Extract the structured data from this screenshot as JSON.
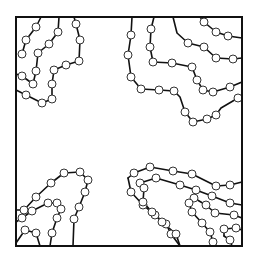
{
  "diagram": {
    "frame": {
      "x": 16,
      "y": 17,
      "width": 226,
      "height": 229
    },
    "colors": {
      "line": "#111111",
      "node_fill": "#ffffff",
      "node_stroke": "#333333",
      "background": "#ffffff"
    },
    "node_radius": 4,
    "paths": [
      {
        "id": "tl-1",
        "points": [
          [
            41,
            17
          ],
          [
            36,
            27
          ],
          [
            26,
            40
          ],
          [
            22,
            54
          ]
        ]
      },
      {
        "id": "tl-2",
        "points": [
          [
            59,
            17
          ],
          [
            58,
            32
          ],
          [
            49,
            44
          ],
          [
            38,
            53
          ],
          [
            36,
            71
          ],
          [
            33,
            84
          ],
          [
            22,
            76
          ],
          [
            16,
            74
          ]
        ]
      },
      {
        "id": "tl-3",
        "points": [
          [
            74,
            17
          ],
          [
            76,
            24
          ],
          [
            80,
            40
          ],
          [
            79,
            61
          ],
          [
            66,
            65
          ],
          [
            54,
            70
          ],
          [
            52,
            84
          ],
          [
            52,
            99
          ],
          [
            42,
            103
          ],
          [
            26,
            95
          ],
          [
            16,
            90
          ]
        ]
      },
      {
        "id": "tr-1",
        "points": [
          [
            132,
            17
          ],
          [
            131,
            35
          ],
          [
            128,
            55
          ],
          [
            131,
            77
          ],
          [
            141,
            89
          ],
          [
            159,
            90
          ],
          [
            174,
            91
          ],
          [
            180,
            97
          ],
          [
            185,
            112
          ],
          [
            193,
            122
          ],
          [
            207,
            119
          ],
          [
            216,
            115
          ],
          [
            221,
            108
          ],
          [
            238,
            98
          ],
          [
            242,
            96
          ]
        ]
      },
      {
        "id": "tr-2",
        "points": [
          [
            154,
            17
          ],
          [
            151,
            29
          ],
          [
            150,
            47
          ],
          [
            153,
            62
          ],
          [
            172,
            63
          ],
          [
            192,
            67
          ],
          [
            197,
            80
          ],
          [
            203,
            90
          ],
          [
            213,
            92
          ],
          [
            230,
            87
          ],
          [
            242,
            82
          ]
        ]
      },
      {
        "id": "tr-3",
        "points": [
          [
            173,
            17
          ],
          [
            177,
            33
          ],
          [
            188,
            43
          ],
          [
            204,
            47
          ],
          [
            216,
            58
          ],
          [
            233,
            59
          ],
          [
            242,
            58
          ]
        ]
      },
      {
        "id": "tr-4",
        "points": [
          [
            200,
            17
          ],
          [
            204,
            22
          ],
          [
            216,
            32
          ],
          [
            228,
            36
          ],
          [
            242,
            38
          ]
        ]
      },
      {
        "id": "bl-1",
        "points": [
          [
            16,
            210
          ],
          [
            24,
            210
          ],
          [
            36,
            197
          ],
          [
            51,
            183
          ],
          [
            64,
            173
          ],
          [
            80,
            172
          ],
          [
            88,
            180
          ],
          [
            85,
            192
          ],
          [
            79,
            207
          ],
          [
            74,
            219
          ],
          [
            73,
            246
          ]
        ]
      },
      {
        "id": "bl-2",
        "points": [
          [
            16,
            222
          ],
          [
            22,
            218
          ],
          [
            32,
            211
          ],
          [
            48,
            203
          ],
          [
            57,
            203
          ],
          [
            61,
            209
          ],
          [
            57,
            218
          ],
          [
            52,
            233
          ],
          [
            50,
            246
          ]
        ]
      },
      {
        "id": "bl-3",
        "points": [
          [
            16,
            243
          ],
          [
            25,
            230
          ],
          [
            36,
            233
          ],
          [
            40,
            246
          ]
        ]
      },
      {
        "id": "br-1",
        "points": [
          [
            128,
            178
          ],
          [
            134,
            173
          ],
          [
            150,
            167
          ],
          [
            173,
            171
          ],
          [
            192,
            174
          ],
          [
            216,
            186
          ],
          [
            230,
            185
          ],
          [
            242,
            182
          ]
        ]
      },
      {
        "id": "br-2",
        "points": [
          [
            140,
            183
          ],
          [
            156,
            178
          ],
          [
            180,
            185
          ],
          [
            196,
            190
          ],
          [
            212,
            196
          ],
          [
            230,
            203
          ],
          [
            242,
            205
          ]
        ]
      },
      {
        "id": "br-3",
        "points": [
          [
            128,
            178
          ],
          [
            131,
            192
          ],
          [
            143,
            205
          ],
          [
            155,
            215
          ],
          [
            166,
            224
          ],
          [
            171,
            234
          ],
          [
            180,
            246
          ]
        ]
      },
      {
        "id": "br-4",
        "points": [
          [
            144,
            188
          ],
          [
            143,
            202
          ],
          [
            152,
            212
          ],
          [
            162,
            222
          ],
          [
            176,
            234
          ],
          [
            180,
            246
          ]
        ]
      },
      {
        "id": "br-5",
        "points": [
          [
            189,
            203
          ],
          [
            194,
            198
          ],
          [
            206,
            205
          ],
          [
            215,
            213
          ],
          [
            234,
            215
          ],
          [
            242,
            218
          ]
        ]
      },
      {
        "id": "br-6",
        "points": [
          [
            189,
            203
          ],
          [
            192,
            212
          ],
          [
            202,
            223
          ],
          [
            210,
            232
          ],
          [
            213,
            242
          ],
          [
            216,
            246
          ]
        ]
      },
      {
        "id": "br-7",
        "points": [
          [
            224,
            236
          ],
          [
            224,
            229
          ],
          [
            236,
            228
          ],
          [
            242,
            230
          ]
        ]
      },
      {
        "id": "br-8",
        "points": [
          [
            224,
            236
          ],
          [
            230,
            240
          ],
          [
            232,
            246
          ]
        ]
      }
    ],
    "nodes": [
      [
        36,
        27
      ],
      [
        26,
        40
      ],
      [
        22,
        54
      ],
      [
        58,
        32
      ],
      [
        49,
        44
      ],
      [
        38,
        53
      ],
      [
        36,
        71
      ],
      [
        33,
        84
      ],
      [
        22,
        76
      ],
      [
        76,
        24
      ],
      [
        80,
        40
      ],
      [
        79,
        61
      ],
      [
        66,
        65
      ],
      [
        54,
        70
      ],
      [
        52,
        84
      ],
      [
        52,
        99
      ],
      [
        42,
        103
      ],
      [
        26,
        95
      ],
      [
        131,
        35
      ],
      [
        128,
        55
      ],
      [
        131,
        77
      ],
      [
        141,
        89
      ],
      [
        159,
        90
      ],
      [
        174,
        91
      ],
      [
        185,
        112
      ],
      [
        193,
        122
      ],
      [
        207,
        119
      ],
      [
        216,
        115
      ],
      [
        238,
        98
      ],
      [
        151,
        29
      ],
      [
        150,
        47
      ],
      [
        153,
        62
      ],
      [
        172,
        63
      ],
      [
        192,
        67
      ],
      [
        197,
        80
      ],
      [
        203,
        90
      ],
      [
        213,
        92
      ],
      [
        230,
        87
      ],
      [
        188,
        43
      ],
      [
        204,
        47
      ],
      [
        216,
        58
      ],
      [
        233,
        59
      ],
      [
        204,
        22
      ],
      [
        216,
        32
      ],
      [
        228,
        36
      ],
      [
        24,
        210
      ],
      [
        36,
        197
      ],
      [
        51,
        183
      ],
      [
        64,
        173
      ],
      [
        80,
        172
      ],
      [
        88,
        180
      ],
      [
        85,
        192
      ],
      [
        79,
        207
      ],
      [
        74,
        219
      ],
      [
        22,
        218
      ],
      [
        32,
        211
      ],
      [
        48,
        203
      ],
      [
        57,
        203
      ],
      [
        61,
        209
      ],
      [
        57,
        218
      ],
      [
        52,
        233
      ],
      [
        25,
        230
      ],
      [
        36,
        233
      ],
      [
        134,
        173
      ],
      [
        150,
        167
      ],
      [
        173,
        171
      ],
      [
        192,
        174
      ],
      [
        216,
        186
      ],
      [
        230,
        185
      ],
      [
        156,
        178
      ],
      [
        180,
        185
      ],
      [
        196,
        190
      ],
      [
        212,
        196
      ],
      [
        230,
        203
      ],
      [
        140,
        183
      ],
      [
        131,
        192
      ],
      [
        143,
        205
      ],
      [
        155,
        215
      ],
      [
        166,
        224
      ],
      [
        171,
        234
      ],
      [
        144,
        188
      ],
      [
        143,
        202
      ],
      [
        152,
        212
      ],
      [
        162,
        222
      ],
      [
        176,
        234
      ],
      [
        194,
        198
      ],
      [
        206,
        205
      ],
      [
        215,
        213
      ],
      [
        234,
        215
      ],
      [
        189,
        203
      ],
      [
        192,
        212
      ],
      [
        202,
        223
      ],
      [
        210,
        232
      ],
      [
        213,
        242
      ],
      [
        224,
        229
      ],
      [
        236,
        228
      ],
      [
        230,
        240
      ]
    ]
  }
}
